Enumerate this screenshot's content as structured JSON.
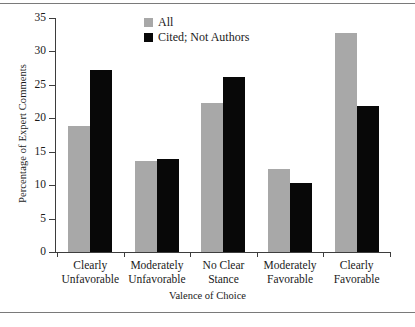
{
  "chart_data": {
    "type": "bar",
    "title": "",
    "xlabel": "Valence of Choice",
    "ylabel": "Percentage of Expert Comments",
    "ylim": [
      0,
      35
    ],
    "yticks": [
      0,
      5,
      10,
      15,
      20,
      25,
      30,
      35
    ],
    "ytick_labels": [
      "0",
      "5",
      "10",
      "15",
      "20",
      "25",
      "30",
      "35"
    ],
    "grid": false,
    "legend_position": "top-center",
    "categories": [
      "Clearly Unfavorable",
      "Moderately Unfavorable",
      "No Clear Stance",
      "Moderately Favorable",
      "Clearly Favorable"
    ],
    "category_lines": [
      [
        "Clearly",
        "Unfavorable"
      ],
      [
        "Moderately",
        "Unfavorable"
      ],
      [
        "No Clear",
        "Stance"
      ],
      [
        "Moderately",
        "Favorable"
      ],
      [
        "Clearly",
        "Favorable"
      ]
    ],
    "series": [
      {
        "name": "All",
        "color": "#a8a8a8",
        "values": [
          18.8,
          13.6,
          22.3,
          12.4,
          32.8
        ]
      },
      {
        "name": "Cited; Not Authors",
        "color": "#080808",
        "values": [
          27.2,
          13.9,
          26.2,
          10.3,
          21.8
        ]
      }
    ]
  },
  "legend": {
    "items": [
      {
        "label": "All",
        "swatch": "all"
      },
      {
        "label": "Cited; Not Authors",
        "swatch": "cited"
      }
    ]
  },
  "axes": {
    "y_title": "Percentage of Expert Comments",
    "x_title": "Valence of Choice"
  }
}
